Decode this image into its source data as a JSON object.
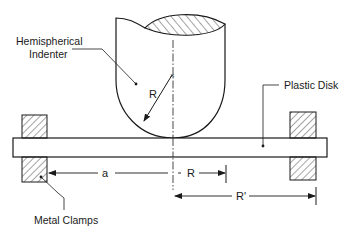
{
  "diagram": {
    "labels": {
      "indenter_line1": "Hemispherical",
      "indenter_line2": "Indenter",
      "disk": "Plastic Disk",
      "clamps": "Metal Clamps"
    },
    "dimensions": {
      "radius_indenter": "R",
      "a": "a",
      "R": "R",
      "R_prime": "R'"
    },
    "colors": {
      "stroke": "#1a1a1a",
      "background": "#ffffff"
    }
  }
}
